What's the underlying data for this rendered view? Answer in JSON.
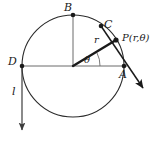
{
  "figure": {
    "kind": "polar-coordinate-circle-diagram",
    "canvas": {
      "width": 164,
      "height": 142,
      "background": "#ffffff"
    },
    "stroke_color": "#1a1a1a",
    "thin_stroke_color": "#4d4d4d",
    "labels": {
      "point_b": "B",
      "point_c": "C",
      "point_p": "P(r,θ)",
      "point_d": "D",
      "point_a": "A",
      "radius": "r",
      "angle": "θ",
      "line_l": "l"
    },
    "geometry": {
      "circle": {
        "cx": 73,
        "cy": 66,
        "r": 51
      },
      "points": {
        "center": {
          "x": 73,
          "y": 66
        },
        "B": {
          "x": 73,
          "y": 15
        },
        "C": {
          "x": 101,
          "y": 26
        },
        "P": {
          "x": 116,
          "y": 40
        },
        "D": {
          "x": 22,
          "y": 66
        },
        "A": {
          "x": 124,
          "y": 66
        }
      },
      "radius_vector": {
        "from": "center",
        "to": "P",
        "label": "r"
      },
      "angle_arc": {
        "vertex": "center",
        "degrees": 27,
        "label": "θ"
      },
      "tangent_arrow": {
        "from": {
          "x": 101,
          "y": 26
        },
        "to": {
          "x": 144,
          "y": 89
        }
      },
      "vertical_arrow": {
        "from": {
          "x": 22,
          "y": 66
        },
        "to": {
          "x": 22,
          "y": 132
        },
        "label": "l"
      }
    }
  }
}
